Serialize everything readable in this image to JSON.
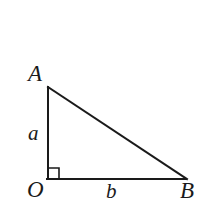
{
  "figure": {
    "background_color": "#ffffff",
    "stroke_color": "#1a1a1a",
    "stroke_width": 2,
    "vertices": {
      "A": {
        "x": 48,
        "y": 87
      },
      "O": {
        "x": 48,
        "y": 179
      },
      "B": {
        "x": 186,
        "y": 179
      }
    },
    "labels": {
      "vertex_a_top": "A",
      "vertex_origin": "O",
      "vertex_b_right": "B",
      "side_vertical": "a",
      "side_horizontal": "b"
    },
    "right_angle": {
      "at_vertex": "O",
      "marker_size": 11
    },
    "edges": [
      {
        "name": "leg-vertical-OA",
        "from": "O",
        "to": "A"
      },
      {
        "name": "leg-horizontal-OB",
        "from": "O",
        "to": "B"
      },
      {
        "name": "hypotenuse-AB",
        "from": "A",
        "to": "B"
      }
    ]
  }
}
